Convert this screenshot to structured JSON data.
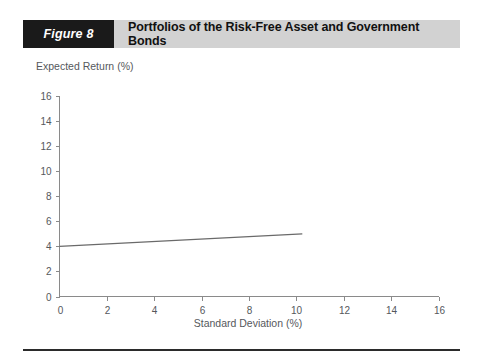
{
  "figure": {
    "badge_label": "Figure 8",
    "title": "Portfolios of the Risk-Free Asset and Government Bonds",
    "badge_bg": "#1a1a1a",
    "header_bg": "#d2d2d2",
    "rule_color": "#2b2b2b"
  },
  "chart_data": {
    "type": "line",
    "title": "Portfolios of the Risk-Free Asset and Government Bonds",
    "xlabel": "Standard Deviation (%)",
    "ylabel": "Expected Return (%)",
    "xlim": [
      0,
      16
    ],
    "ylim": [
      0,
      16
    ],
    "xticks": [
      0,
      2,
      4,
      6,
      8,
      10,
      12,
      14,
      16
    ],
    "yticks": [
      0,
      2,
      4,
      6,
      8,
      10,
      12,
      14,
      16
    ],
    "xtick_labels": [
      "0",
      "2",
      "4",
      "6",
      "8",
      "10",
      "12",
      "14",
      "16"
    ],
    "ytick_labels": [
      "0",
      "2",
      "4",
      "6",
      "8",
      "10",
      "12",
      "14",
      "16"
    ],
    "grid": false,
    "legend": false,
    "series": [
      {
        "name": "Capital allocation line",
        "color": "#6a6a6a",
        "x": [
          0,
          10.25
        ],
        "y": [
          4.0,
          5.0
        ]
      }
    ]
  },
  "axis_labels": {
    "y_title": "Expected Return (%)",
    "x_title": "Standard Deviation (%)"
  }
}
